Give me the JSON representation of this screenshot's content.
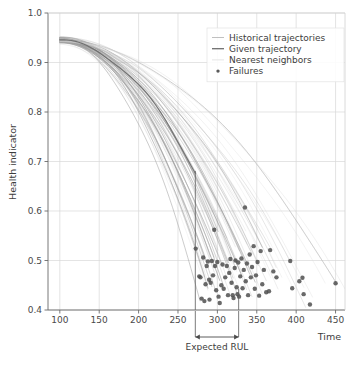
{
  "chart_data": {
    "type": "line",
    "title": "",
    "xlabel": "Time",
    "ylabel": "Health indicator",
    "xlim": [
      85,
      462
    ],
    "ylim": [
      0.4,
      1.0
    ],
    "xticks": [
      100,
      150,
      200,
      250,
      300,
      350,
      400,
      450
    ],
    "xtick_labels": [
      "100",
      "150",
      "200",
      "250",
      "300",
      "350",
      "400",
      "450"
    ],
    "yticks": [
      0.4,
      0.5,
      0.6,
      0.7,
      0.8,
      0.9,
      1.0
    ],
    "ytick_labels": [
      "0.4",
      "0.5",
      "0.6",
      "0.7",
      "0.8",
      "0.9",
      "1.0"
    ],
    "grid": true,
    "legend_position": "upper right",
    "legend": [
      {
        "label": "Historical trajectories",
        "marker": "line",
        "color": "#b9b9b9"
      },
      {
        "label": "Given trajectory",
        "marker": "line",
        "color": "#6e6e6e"
      },
      {
        "label": "Nearest neighbors",
        "marker": "line",
        "color": "#e2e2e2"
      },
      {
        "label": "Failures",
        "marker": "dot",
        "color": "#5a5a5a"
      }
    ],
    "annotations": [
      {
        "text": "Expected RUL",
        "type": "double-arrow-span",
        "x_start": 272,
        "x_end": 327,
        "y_pixel_offset": 27
      },
      {
        "text": "",
        "type": "vertical-line",
        "x": 272,
        "y_top": 0.681,
        "y_bottom": 0.4
      },
      {
        "text": "",
        "type": "vertical-line",
        "x": 327,
        "y_top": 0.443,
        "y_bottom": 0.4
      }
    ],
    "series": [
      {
        "name": "Historical trajectories",
        "style": "thin-gray-lines",
        "color": "#9a9a9a",
        "opacity": 0.45,
        "count": 34,
        "x_start": 100,
        "y_start": 0.945,
        "description": "Degradation curves decaying from ~0.945 at t=100 toward failure between t=275 and t=455",
        "end_times": [
          278,
          284,
          286,
          288,
          291,
          293,
          296,
          298,
          300,
          301,
          303,
          306,
          308,
          311,
          314,
          317,
          320,
          322,
          325,
          328,
          331,
          334,
          337,
          341,
          344,
          348,
          352,
          357,
          362,
          368,
          377,
          392,
          412,
          452
        ],
        "end_values": [
          0.424,
          0.468,
          0.494,
          0.441,
          0.512,
          0.452,
          0.505,
          0.432,
          0.498,
          0.564,
          0.462,
          0.486,
          0.443,
          0.472,
          0.501,
          0.427,
          0.459,
          0.488,
          0.438,
          0.523,
          0.466,
          0.497,
          0.443,
          0.478,
          0.514,
          0.451,
          0.487,
          0.531,
          0.464,
          0.521,
          0.437,
          0.499,
          0.411,
          0.454
        ]
      },
      {
        "name": "Given trajectory",
        "style": "bold-gray-line",
        "color": "#6a6a6a",
        "opacity": 1.0,
        "x_start": 100,
        "x_end": 272,
        "y_start": 0.945,
        "y_end": 0.681,
        "description": "Single darker observed curve truncated at the present time t=272"
      },
      {
        "name": "Nearest neighbors",
        "style": "very-faint-lines",
        "color": "#d8d8d8",
        "opacity": 0.35,
        "count": 8,
        "description": "Faintest matched trajectories extending to the far right of the plot"
      }
    ],
    "failures": {
      "name": "Failures",
      "marker": "dot",
      "color": "#4f4f4f",
      "size": 2.2,
      "points": [
        [
          272.5,
          0.524
        ],
        [
          277.0,
          0.468
        ],
        [
          278.5,
          0.466
        ],
        [
          280.0,
          0.423
        ],
        [
          282.0,
          0.506
        ],
        [
          283.5,
          0.418
        ],
        [
          285.0,
          0.452
        ],
        [
          286.5,
          0.489
        ],
        [
          288.0,
          0.498
        ],
        [
          289.5,
          0.461
        ],
        [
          290.0,
          0.421
        ],
        [
          291.5,
          0.455
        ],
        [
          293.0,
          0.499
        ],
        [
          294.5,
          0.47
        ],
        [
          296.0,
          0.562
        ],
        [
          297.0,
          0.489
        ],
        [
          298.5,
          0.44
        ],
        [
          300.0,
          0.497
        ],
        [
          301.5,
          0.427
        ],
        [
          303.0,
          0.414
        ],
        [
          305.0,
          0.45
        ],
        [
          306.5,
          0.492
        ],
        [
          308.0,
          0.443
        ],
        [
          310.0,
          0.466
        ],
        [
          312.0,
          0.489
        ],
        [
          313.5,
          0.43
        ],
        [
          315.0,
          0.475
        ],
        [
          316.5,
          0.503
        ],
        [
          318.0,
          0.455
        ],
        [
          319.5,
          0.43
        ],
        [
          320.5,
          0.424
        ],
        [
          322.0,
          0.485
        ],
        [
          323.0,
          0.5
        ],
        [
          324.5,
          0.446
        ],
        [
          325.5,
          0.432
        ],
        [
          326.5,
          0.496
        ],
        [
          327.5,
          0.427
        ],
        [
          329.0,
          0.468
        ],
        [
          330.5,
          0.504
        ],
        [
          332.0,
          0.444
        ],
        [
          333.5,
          0.481
        ],
        [
          335.0,
          0.607
        ],
        [
          336.0,
          0.458
        ],
        [
          337.5,
          0.494
        ],
        [
          339.0,
          0.43
        ],
        [
          341.0,
          0.512
        ],
        [
          342.5,
          0.466
        ],
        [
          344.0,
          0.487
        ],
        [
          346.0,
          0.529
        ],
        [
          347.5,
          0.443
        ],
        [
          349.0,
          0.47
        ],
        [
          351.0,
          0.497
        ],
        [
          353.0,
          0.429
        ],
        [
          355.0,
          0.519
        ],
        [
          357.0,
          0.452
        ],
        [
          359.0,
          0.481
        ],
        [
          362.0,
          0.436
        ],
        [
          365.5,
          0.438
        ],
        [
          367.0,
          0.521
        ],
        [
          371.0,
          0.478
        ],
        [
          375.0,
          0.466
        ],
        [
          392.5,
          0.499
        ],
        [
          395.0,
          0.444
        ],
        [
          404.0,
          0.458
        ],
        [
          408.0,
          0.465
        ],
        [
          409.5,
          0.432
        ],
        [
          417.5,
          0.411
        ],
        [
          450.0,
          0.454
        ]
      ]
    }
  }
}
